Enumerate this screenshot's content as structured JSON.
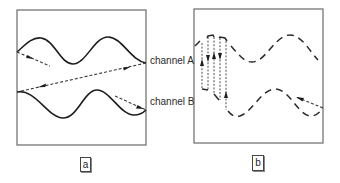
{
  "figure": {
    "labels": {
      "channel_a": "channel A",
      "channel_b": "channel B"
    },
    "panels": [
      {
        "id": "a",
        "tag": "a",
        "trace_style": "solid"
      },
      {
        "id": "b",
        "tag": "b",
        "trace_style": "dashed"
      }
    ],
    "colors": {
      "frame": "#6a6a6a",
      "trace": "#1e1e1e",
      "background": "#ffffff"
    }
  }
}
